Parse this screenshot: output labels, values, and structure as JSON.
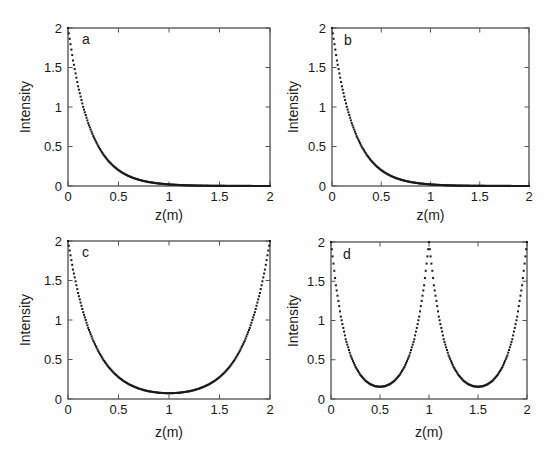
{
  "figure": {
    "colors": {
      "ink": "#1a1a1a",
      "axis": "#3f3f3f",
      "tick": "#555555",
      "bg": "#fefefe"
    },
    "marker": "square-dot",
    "marker_size_px": 2
  },
  "chart_data": [
    {
      "type": "scatter",
      "panel": "a",
      "title": "",
      "xlabel": "z(m)",
      "ylabel": "Intensity",
      "xlim": [
        0,
        2
      ],
      "ylim": [
        0,
        2
      ],
      "xticks": [
        0,
        0.5,
        1,
        1.5,
        2
      ],
      "yticks": [
        0,
        0.5,
        1,
        1.5,
        2
      ],
      "x": [
        0,
        0.05,
        0.1,
        0.15,
        0.2,
        0.25,
        0.3,
        0.35,
        0.4,
        0.45,
        0.5,
        0.55,
        0.6,
        0.65,
        0.7,
        0.75,
        0.8,
        0.85,
        0.9,
        0.95,
        1,
        1.05,
        1.1,
        1.15,
        1.2,
        1.25,
        1.3,
        1.35,
        1.4,
        1.45,
        1.5,
        1.55,
        1.6,
        1.65,
        1.7,
        1.75,
        1.8,
        1.85,
        1.9,
        1.95,
        2
      ],
      "y": [
        2.0,
        1.589,
        1.262,
        1.002,
        0.796,
        0.632,
        0.502,
        0.399,
        0.317,
        0.252,
        0.2,
        0.159,
        0.126,
        0.1,
        0.08,
        0.063,
        0.05,
        0.04,
        0.032,
        0.025,
        0.02,
        0.016,
        0.013,
        0.01,
        0.008,
        0.006,
        0.005,
        0.004,
        0.003,
        0.003,
        0.002,
        0.002,
        0.001,
        0.001,
        0.001,
        0.001,
        0.001,
        0.0,
        0.0,
        0.0,
        0.0
      ]
    },
    {
      "type": "scatter",
      "panel": "b",
      "title": "",
      "xlabel": "z(m)",
      "ylabel": "Intensity",
      "xlim": [
        0,
        2
      ],
      "ylim": [
        0,
        2
      ],
      "xticks": [
        0,
        0.5,
        1,
        1.5,
        2
      ],
      "yticks": [
        0,
        0.5,
        1,
        1.5,
        2
      ],
      "x": [
        0,
        0.05,
        0.1,
        0.15,
        0.2,
        0.25,
        0.3,
        0.35,
        0.4,
        0.45,
        0.5,
        0.55,
        0.6,
        0.65,
        0.7,
        0.75,
        0.8,
        0.85,
        0.9,
        0.95,
        1,
        1.05,
        1.1,
        1.15,
        1.2,
        1.25,
        1.3,
        1.35,
        1.4,
        1.45,
        1.5,
        1.55,
        1.6,
        1.65,
        1.7,
        1.75,
        1.8,
        1.85,
        1.9,
        1.95,
        2
      ],
      "y": [
        2.0,
        1.589,
        1.262,
        1.002,
        0.796,
        0.632,
        0.502,
        0.399,
        0.317,
        0.252,
        0.2,
        0.159,
        0.126,
        0.1,
        0.08,
        0.063,
        0.05,
        0.04,
        0.032,
        0.025,
        0.02,
        0.016,
        0.013,
        0.01,
        0.008,
        0.006,
        0.005,
        0.004,
        0.003,
        0.003,
        0.002,
        0.002,
        0.001,
        0.001,
        0.001,
        0.001,
        0.001,
        0.0,
        0.0,
        0.0,
        0.0
      ]
    },
    {
      "type": "scatter",
      "panel": "c",
      "title": "",
      "xlabel": "z(m)",
      "ylabel": "Intensity",
      "xlim": [
        0,
        2
      ],
      "ylim": [
        0,
        2
      ],
      "xticks": [
        0,
        0.5,
        1,
        1.5,
        2
      ],
      "yticks": [
        0,
        0.5,
        1,
        1.5,
        2
      ],
      "x": [
        0,
        0.05,
        0.1,
        0.15,
        0.2,
        0.25,
        0.3,
        0.35,
        0.4,
        0.45,
        0.5,
        0.55,
        0.6,
        0.65,
        0.7,
        0.75,
        0.8,
        0.85,
        0.9,
        0.95,
        1,
        1.05,
        1.1,
        1.15,
        1.2,
        1.25,
        1.3,
        1.35,
        1.4,
        1.45,
        1.5,
        1.55,
        1.6,
        1.65,
        1.7,
        1.75,
        1.8,
        1.85,
        1.9,
        1.95,
        2
      ],
      "y": [
        2.0,
        1.638,
        1.342,
        1.099,
        0.9,
        0.738,
        0.605,
        0.496,
        0.407,
        0.335,
        0.276,
        0.228,
        0.189,
        0.158,
        0.133,
        0.113,
        0.098,
        0.087,
        0.079,
        0.075,
        0.073,
        0.075,
        0.079,
        0.087,
        0.098,
        0.113,
        0.133,
        0.158,
        0.189,
        0.228,
        0.276,
        0.335,
        0.407,
        0.496,
        0.605,
        0.738,
        0.9,
        1.099,
        1.342,
        1.638,
        2.0
      ]
    },
    {
      "type": "scatter",
      "panel": "d",
      "title": "",
      "xlabel": "z(m)",
      "ylabel": "Intensity",
      "xlim": [
        0,
        2
      ],
      "ylim": [
        0,
        2
      ],
      "xticks": [
        0,
        0.5,
        1,
        1.5,
        2
      ],
      "yticks": [
        0,
        0.5,
        1,
        1.5,
        2
      ],
      "x": [
        0,
        0.05,
        0.1,
        0.15,
        0.2,
        0.25,
        0.3,
        0.35,
        0.4,
        0.45,
        0.5,
        0.55,
        0.6,
        0.65,
        0.7,
        0.75,
        0.8,
        0.85,
        0.9,
        0.95,
        1,
        1.05,
        1.1,
        1.15,
        1.2,
        1.25,
        1.3,
        1.35,
        1.4,
        1.45,
        1.5,
        1.55,
        1.6,
        1.65,
        1.7,
        1.75,
        1.8,
        1.85,
        1.9,
        1.95,
        2
      ],
      "y": [
        2.0,
        1.449,
        1.05,
        0.762,
        0.556,
        0.409,
        0.306,
        0.235,
        0.189,
        0.163,
        0.155,
        0.163,
        0.189,
        0.235,
        0.306,
        0.409,
        0.556,
        0.762,
        1.05,
        1.449,
        2.0,
        1.449,
        1.05,
        0.762,
        0.556,
        0.409,
        0.306,
        0.235,
        0.189,
        0.163,
        0.155,
        0.163,
        0.189,
        0.235,
        0.306,
        0.409,
        0.556,
        0.762,
        1.05,
        1.449,
        2.0
      ]
    }
  ]
}
